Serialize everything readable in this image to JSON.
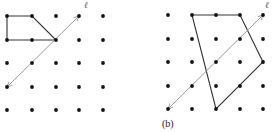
{
  "figure": {
    "panel_a": {
      "grid": {
        "cols": [
          7,
          32,
          56,
          79,
          103
        ],
        "rows": [
          16,
          40,
          63,
          87,
          110
        ]
      },
      "polygon": [
        [
          7,
          16
        ],
        [
          32,
          16
        ],
        [
          56,
          40
        ],
        [
          7,
          40
        ]
      ],
      "line": {
        "from": [
          7,
          87
        ],
        "to": [
          79,
          16
        ],
        "label": "ℓ",
        "label_pos": [
          84,
          3
        ]
      },
      "caption": ""
    },
    "panel_b": {
      "grid": {
        "cols": [
          168,
          192,
          216,
          240,
          263
        ],
        "rows": [
          15,
          39,
          62,
          86,
          109
        ]
      },
      "polygon": [
        [
          192,
          15
        ],
        [
          240,
          15
        ],
        [
          263,
          62
        ],
        [
          216,
          109
        ]
      ],
      "line": {
        "from": [
          168,
          109
        ],
        "to": [
          263,
          15
        ],
        "label": "ℓ",
        "label_pos": [
          266,
          2
        ]
      },
      "caption": "(b)"
    },
    "colors": {
      "dot": "#111111",
      "polygon": "#333333",
      "line": "#999999"
    }
  }
}
